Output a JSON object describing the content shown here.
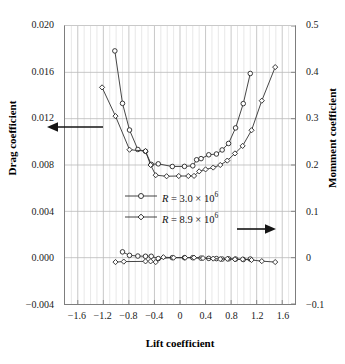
{
  "chart_data": {
    "type": "line",
    "title": "",
    "xlabel": "Lift coefficient",
    "ylabel": "Drag coefficient",
    "ylabel_right": "Momment coefficient",
    "xlim": [
      -1.8,
      1.8
    ],
    "ylim": [
      -0.004,
      0.02
    ],
    "ylim_right": [
      -0.1,
      0.5
    ],
    "xticks": [
      "-1.6",
      "-1.2",
      "-0.8",
      "-0.4",
      "0",
      "0.4",
      "0.8",
      "1.2",
      "1.6"
    ],
    "xtick_values": [
      -1.6,
      -1.2,
      -0.8,
      -0.4,
      0,
      0.4,
      0.8,
      1.2,
      1.6
    ],
    "yticks_left": [
      "0.020",
      "0.016",
      "0.012",
      "0.008",
      "0.004",
      "0.000",
      "-0.004"
    ],
    "ytick_values_left": [
      0.02,
      0.016,
      0.012,
      0.008,
      0.004,
      0.0,
      -0.004
    ],
    "yticks_right": [
      "0.5",
      "0.4",
      "0.3",
      "0.2",
      "0.1",
      "0",
      "-0.1"
    ],
    "ytick_values_right": [
      0.5,
      0.4,
      0.3,
      0.2,
      0.1,
      0.0,
      -0.1
    ],
    "grid": "major horizontal + minor vertical",
    "legend_position": "center",
    "annotations": [
      {
        "name": "left-arrow",
        "points": "left",
        "meaning": "drag curves use left axis"
      },
      {
        "name": "right-arrow",
        "points": "right",
        "meaning": "moment curves use right axis"
      }
    ],
    "series": [
      {
        "name": "R = 3.0 × 10⁶ drag",
        "axis": "left",
        "marker": "circle",
        "points": [
          [
            -1.02,
            0.01785
          ],
          [
            -0.9,
            0.01332
          ],
          [
            -0.79,
            0.01102
          ],
          [
            -0.66,
            0.00934
          ],
          [
            -0.54,
            0.00918
          ],
          [
            -0.45,
            0.00805
          ],
          [
            -0.34,
            0.0081
          ],
          [
            -0.12,
            0.00787
          ],
          [
            0.07,
            0.00788
          ],
          [
            0.2,
            0.00793
          ],
          [
            0.26,
            0.00845
          ],
          [
            0.33,
            0.00855
          ],
          [
            0.45,
            0.00888
          ],
          [
            0.57,
            0.00895
          ],
          [
            0.66,
            0.0093
          ],
          [
            0.76,
            0.00986
          ],
          [
            0.87,
            0.0112
          ],
          [
            0.99,
            0.0133
          ],
          [
            1.1,
            0.0159
          ]
        ]
      },
      {
        "name": "R = 8.9 × 10⁶ drag",
        "axis": "left",
        "marker": "diamond",
        "points": [
          [
            -1.22,
            0.0147
          ],
          [
            -1.01,
            0.01222
          ],
          [
            -0.79,
            0.00932
          ],
          [
            -0.54,
            0.0092
          ],
          [
            -0.46,
            0.008
          ],
          [
            -0.38,
            0.00712
          ],
          [
            -0.21,
            0.00703
          ],
          [
            -0.02,
            0.00705
          ],
          [
            0.13,
            0.00705
          ],
          [
            0.22,
            0.00706
          ],
          [
            0.3,
            0.00745
          ],
          [
            0.4,
            0.00762
          ],
          [
            0.52,
            0.00778
          ],
          [
            0.63,
            0.008
          ],
          [
            0.74,
            0.00838
          ],
          [
            0.86,
            0.009
          ],
          [
            0.98,
            0.00965
          ],
          [
            1.12,
            0.011
          ],
          [
            1.28,
            0.01355
          ],
          [
            1.49,
            0.01645
          ]
        ]
      },
      {
        "name": "R = 3.0 × 10⁶ moment",
        "axis": "right",
        "marker": "circle",
        "points": [
          [
            -0.9,
            0.0125
          ],
          [
            -0.79,
            0.005
          ],
          [
            -0.66,
            0.0035
          ],
          [
            -0.54,
            0.003
          ],
          [
            -0.45,
            0.003
          ],
          [
            -0.34,
            -0.002
          ],
          [
            -0.12,
            0.0
          ],
          [
            0.07,
            0.0
          ],
          [
            0.2,
            0.0
          ],
          [
            0.33,
            -0.001
          ],
          [
            0.45,
            -0.0015
          ],
          [
            0.57,
            -0.002
          ],
          [
            0.66,
            -0.003
          ],
          [
            0.76,
            -0.0025
          ],
          [
            0.87,
            -0.003
          ],
          [
            0.99,
            -0.004
          ],
          [
            1.1,
            -0.003
          ]
        ]
      },
      {
        "name": "R = 8.9 × 10⁶ moment",
        "axis": "right",
        "marker": "diamond",
        "points": [
          [
            -1.01,
            -0.0095
          ],
          [
            -0.88,
            -0.0085
          ],
          [
            -0.54,
            -0.008
          ],
          [
            -0.46,
            -0.008
          ],
          [
            -0.38,
            -0.0095
          ],
          [
            -0.26,
            0.001
          ],
          [
            -0.1,
            0.0
          ],
          [
            0.08,
            0.0
          ],
          [
            0.22,
            0.0
          ],
          [
            0.36,
            -0.001
          ],
          [
            0.52,
            -0.002
          ],
          [
            0.63,
            -0.003
          ],
          [
            0.74,
            -0.0025
          ],
          [
            0.86,
            -0.0035
          ],
          [
            0.98,
            -0.0035
          ],
          [
            1.12,
            -0.005
          ],
          [
            1.28,
            -0.0075
          ],
          [
            1.49,
            -0.0095
          ]
        ]
      }
    ]
  },
  "legend": {
    "items": [
      {
        "marker": "circle",
        "prefix": "R",
        "equals": " = ",
        "value": "3.0 × 10",
        "exponent": "6"
      },
      {
        "marker": "diamond",
        "prefix": "R",
        "equals": " = ",
        "value": "8.9 × 10",
        "exponent": "6"
      }
    ]
  },
  "axis_titles": {
    "left": "Drag coefficient",
    "right": "Momment coefficient",
    "bottom": "Lift coefficient"
  },
  "colors": {
    "line": "#303030",
    "marker_fill": "#ffffff",
    "marker_stroke": "#242424",
    "grid_major": "#b9b9b9",
    "grid_minor": "#dedede",
    "axis": "#7d7d7d",
    "text": "#151515"
  }
}
